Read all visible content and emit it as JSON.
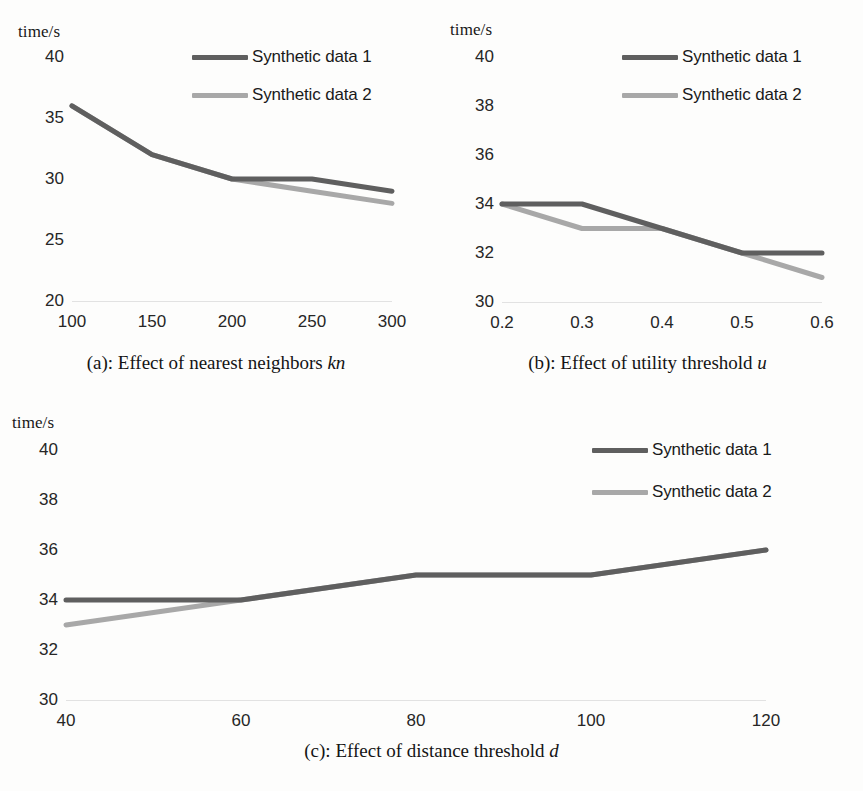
{
  "figure": {
    "series_colors": {
      "synthetic_data_1": "#5f5f5f",
      "synthetic_data_2": "#a8a8a8"
    },
    "legend_labels": {
      "s1": "Synthetic data 1",
      "s2": "Synthetic data 2"
    },
    "y_axis_title": "time/s"
  },
  "panels": {
    "a": {
      "caption_prefix": "(a): Effect of nearest neighbors ",
      "caption_variable": "kn",
      "y_title": "time/s",
      "yticks": [
        "40",
        "35",
        "30",
        "25",
        "20"
      ],
      "xticks": [
        "100",
        "150",
        "200",
        "250",
        "300"
      ]
    },
    "b": {
      "caption_prefix": "(b): Effect of utility threshold ",
      "caption_variable": "u",
      "y_title": "time/s",
      "yticks": [
        "40",
        "38",
        "36",
        "34",
        "32",
        "30"
      ],
      "xticks": [
        "0.2",
        "0.3",
        "0.4",
        "0.5",
        "0.6"
      ]
    },
    "c": {
      "caption_prefix": "(c): Effect of distance threshold ",
      "caption_variable": "d",
      "y_title": "time/s",
      "yticks": [
        "40",
        "38",
        "36",
        "34",
        "32",
        "30"
      ],
      "xticks": [
        "40",
        "60",
        "80",
        "100",
        "120"
      ]
    }
  },
  "chart_data": [
    {
      "id": "a",
      "type": "line",
      "title": "(a): Effect of nearest neighbors kn",
      "xlabel": "kn",
      "ylabel": "time/s",
      "categories": [
        100,
        150,
        200,
        250,
        300
      ],
      "xlim": [
        100,
        300
      ],
      "ylim": [
        20,
        40
      ],
      "yticks": [
        20,
        25,
        30,
        35,
        40
      ],
      "grid": false,
      "legend_position": "top-right",
      "series": [
        {
          "name": "Synthetic data 1",
          "color": "#5f5f5f",
          "values": [
            36,
            32,
            30,
            30,
            29
          ]
        },
        {
          "name": "Synthetic data 2",
          "color": "#a8a8a8",
          "values": [
            36,
            32,
            30,
            29,
            28
          ]
        }
      ]
    },
    {
      "id": "b",
      "type": "line",
      "title": "(b): Effect of utility threshold u",
      "xlabel": "u",
      "ylabel": "time/s",
      "categories": [
        0.2,
        0.3,
        0.4,
        0.5,
        0.6
      ],
      "xlim": [
        0.2,
        0.6
      ],
      "ylim": [
        30,
        40
      ],
      "yticks": [
        30,
        32,
        34,
        36,
        38,
        40
      ],
      "grid": false,
      "legend_position": "top-right",
      "series": [
        {
          "name": "Synthetic data 1",
          "color": "#5f5f5f",
          "values": [
            34,
            34,
            33,
            32,
            32
          ]
        },
        {
          "name": "Synthetic data 2",
          "color": "#a8a8a8",
          "values": [
            34,
            33,
            33,
            32,
            31
          ]
        }
      ]
    },
    {
      "id": "c",
      "type": "line",
      "title": "(c): Effect of distance threshold d",
      "xlabel": "d",
      "ylabel": "time/s",
      "categories": [
        40,
        60,
        80,
        100,
        120
      ],
      "xlim": [
        40,
        120
      ],
      "ylim": [
        30,
        40
      ],
      "yticks": [
        30,
        32,
        34,
        36,
        38,
        40
      ],
      "grid": false,
      "legend_position": "top-right",
      "series": [
        {
          "name": "Synthetic data 1",
          "color": "#5f5f5f",
          "values": [
            34,
            34,
            35,
            35,
            36
          ]
        },
        {
          "name": "Synthetic data 2",
          "color": "#a8a8a8",
          "values": [
            33,
            34,
            35,
            35,
            36
          ]
        }
      ]
    }
  ]
}
